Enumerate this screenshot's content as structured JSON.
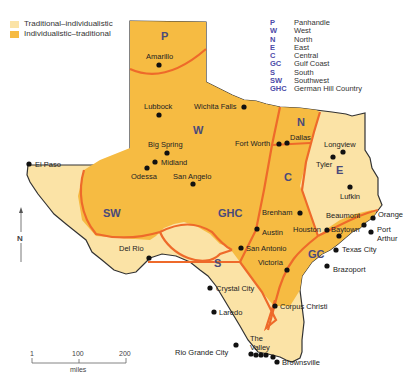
{
  "legend": {
    "items": [
      {
        "label": "Traditional–individualistic",
        "color": "#fbe3a6"
      },
      {
        "label": "Individualistic–traditional",
        "color": "#f6bb42"
      }
    ]
  },
  "key": {
    "items": [
      {
        "abbr": "P",
        "name": "Panhandle"
      },
      {
        "abbr": "W",
        "name": "West"
      },
      {
        "abbr": "N",
        "name": "North"
      },
      {
        "abbr": "E",
        "name": "East"
      },
      {
        "abbr": "C",
        "name": "Central"
      },
      {
        "abbr": "GC",
        "name": "Gulf Coast"
      },
      {
        "abbr": "S",
        "name": "South"
      },
      {
        "abbr": "SW",
        "name": "Southwest"
      },
      {
        "abbr": "GHC",
        "name": "German Hill Country"
      }
    ]
  },
  "regions": {
    "P": "P",
    "W": "W",
    "N": "N",
    "E": "E",
    "C": "C",
    "GC": "GC",
    "S": "S",
    "SW": "SW",
    "GHC": "GHC"
  },
  "cities": [
    "Amarillo",
    "Lubbock",
    "Wichita Falls",
    "Big Spring",
    "Midland",
    "Odessa",
    "San Angelo",
    "El Paso",
    "Fort Worth",
    "Dallas",
    "Longview",
    "Tyler",
    "Lufkin",
    "Brenham",
    "Austin",
    "Houston",
    "Beaumont",
    "Orange",
    "Baytown",
    "Port Arthur",
    "Texas City",
    "Brazoport",
    "San Antonio",
    "Victoria",
    "Del Rio",
    "Crystal City",
    "Corpus Christi",
    "Laredo",
    "The Valley",
    "Rio Grande City",
    "Brownsville"
  ],
  "compass": {
    "label": "N"
  },
  "scale_bar": {
    "ticks": [
      "1",
      "100",
      "200"
    ],
    "unit": "miles"
  },
  "colors": {
    "boundary": "#ee6a2a",
    "light": "#fbe3a6",
    "dark": "#f6bb42",
    "border": "#333333"
  }
}
